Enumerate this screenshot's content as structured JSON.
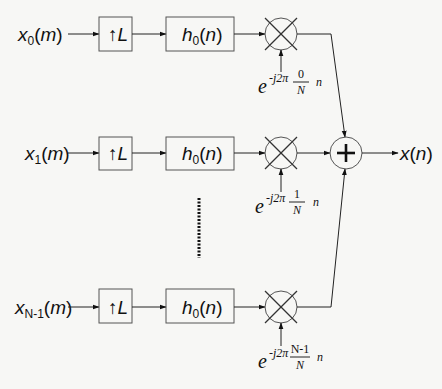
{
  "diagram": {
    "type": "block-diagram",
    "branches": [
      {
        "input": {
          "base": "x",
          "sub": "0",
          "arg": "(m)"
        },
        "upsampler": {
          "arrow": "↑",
          "factor": "L"
        },
        "filter": {
          "base": "h",
          "sub": "0",
          "arg": "(n)"
        },
        "modulator": {
          "e": "e",
          "exp_prefix": "-j2π",
          "numerator": "0",
          "denominator": "N",
          "suffix": "n"
        }
      },
      {
        "input": {
          "base": "x",
          "sub": "1",
          "arg": "(m)"
        },
        "upsampler": {
          "arrow": "↑",
          "factor": "L"
        },
        "filter": {
          "base": "h",
          "sub": "0",
          "arg": "(n)"
        },
        "modulator": {
          "e": "e",
          "exp_prefix": "-j2π",
          "numerator": "1",
          "denominator": "N",
          "suffix": "n"
        }
      },
      {
        "input": {
          "base": "x",
          "sub": "N-1",
          "arg": "(m)"
        },
        "upsampler": {
          "arrow": "↑",
          "factor": "L"
        },
        "filter": {
          "base": "h",
          "sub": "0",
          "arg": "(n)"
        },
        "modulator": {
          "e": "e",
          "exp_prefix": "-j2π",
          "numerator": "N-1",
          "denominator": "N",
          "suffix": "n"
        }
      }
    ],
    "summer": {
      "symbol": "+"
    },
    "output": {
      "base": "x",
      "arg": "(n)"
    },
    "ellipsis": "vertical-dots"
  }
}
